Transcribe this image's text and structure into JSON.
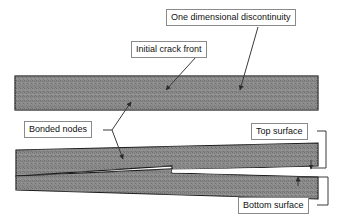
{
  "figure": {
    "kind": "engineering-diagram",
    "background_color": "#ffffff",
    "material_fill_color": "#808080",
    "material_border_color": "#1a1a1a",
    "leader_color": "#3a3a3a",
    "label_border_color": "#8a8a8a",
    "label_text_color": "#111111"
  },
  "callouts": {
    "discontinuity": "One dimensional discontinuity",
    "crack_front": "Initial crack front",
    "bonded_nodes": "Bonded nodes",
    "top_surface": "Top surface",
    "bottom_surface": "Bottom surface"
  },
  "shapes": {
    "plan_view_bar": {
      "name": "upper-hatched-bar",
      "x": 15,
      "y": 76,
      "width": 303,
      "height": 34
    },
    "side_view_wedge": {
      "name": "lower-tapered-bar",
      "note": "Tapered block that splits at the crack tip into an upper arm and a lower arm separated by a white gap."
    }
  },
  "leaders": {
    "crack_front_arrow_tip": {
      "x": 164,
      "y": 93
    },
    "discontinuity_arrow_tip": {
      "x": 238,
      "y": 93
    },
    "bonded_nodes_arrow_tip_upper": {
      "x": 133,
      "y": 99
    },
    "bonded_nodes_arrow_tip_lower": {
      "x": 125,
      "y": 162
    },
    "top_surface_arrow_tip": {
      "x": 309,
      "y": 172
    },
    "bottom_surface_arrow_tip": {
      "x": 296,
      "y": 178
    }
  }
}
